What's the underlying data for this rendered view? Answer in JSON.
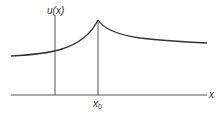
{
  "diagram": {
    "function_label": "u(x)",
    "axis_label": "x",
    "point_label_base": "x",
    "point_label_sub": "0",
    "colors": {
      "stroke": "#333333",
      "background": "#ffffff"
    }
  }
}
